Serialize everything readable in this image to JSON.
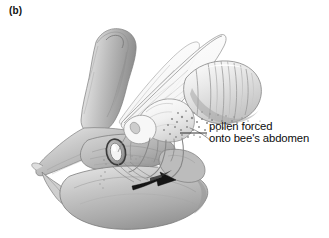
{
  "figure": {
    "panel_label": "(b)",
    "style": "grayscale-scientific-illustration",
    "background_color": "#ffffff"
  },
  "annotation": {
    "line1": "pollen forced",
    "line2": "onto bee's abdomen",
    "text_color": "#0d0d0d",
    "leader_line_color": "#1a1a1a",
    "leader_from_x": 180,
    "leader_from_y": 133,
    "leader_to_x": 207,
    "leader_to_y": 133
  },
  "palette": {
    "outline": "#6f6f6f",
    "dark_outline": "#3a3a3a",
    "petal_light": "#e8e8e8",
    "petal_mid": "#c3c3c3",
    "petal_dark": "#9a9a9a",
    "petal_deep_shadow": "#7c7c7c",
    "bee_body_light": "#f4f4f4",
    "bee_stripe": "#a9a9a9",
    "wing_fill": "#fbfbfb",
    "arrow_dark": "#151515",
    "eye_ring_dark": "#2e2e2e"
  },
  "parts": [
    {
      "id": "banner-petal",
      "label": "standard / banner petal",
      "note": "large curved hood at upper left"
    },
    {
      "id": "wing-petal-left",
      "label": "wing petal",
      "note": "pointed lateral petal at left"
    },
    {
      "id": "keel-petal",
      "label": "keel petal",
      "note": "large rounded lower petal"
    },
    {
      "id": "stigma-ring",
      "label": "stigmatic ring / nectar guide",
      "note": "dark oval ring at flower throat"
    },
    {
      "id": "bee-abdomen",
      "label": "bee abdomen",
      "note": "striped segmented abdomen at right"
    },
    {
      "id": "bee-forewing",
      "label": "bee forewing",
      "note": "translucent veined wing"
    },
    {
      "id": "bee-hindwing",
      "label": "bee hindwing",
      "note": "smaller translucent wing"
    },
    {
      "id": "bee-legs",
      "label": "bee legs",
      "note": "pollen-laden legs gripping the flower"
    },
    {
      "id": "pollen-mass",
      "label": "pollen grains",
      "note": "stippled pollen dusting the underside of the bee"
    },
    {
      "id": "motion-arrow",
      "label": "motion arrow",
      "note": "dark arrow showing keel depression"
    }
  ]
}
